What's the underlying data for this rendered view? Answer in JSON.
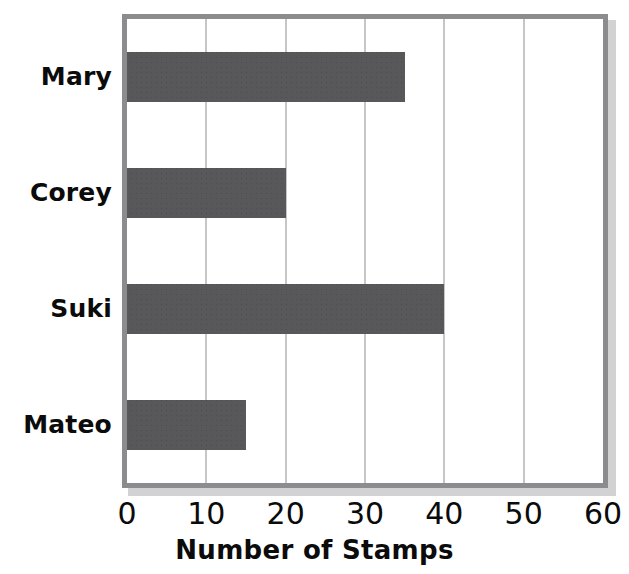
{
  "chart_data": {
    "type": "bar",
    "orientation": "horizontal",
    "title": "",
    "xlabel": "Number of Stamps",
    "ylabel": "",
    "categories": [
      "Mary",
      "Corey",
      "Suki",
      "Mateo"
    ],
    "values": [
      35,
      20,
      40,
      15
    ],
    "xlim": [
      0,
      60
    ],
    "xticks": [
      0,
      10,
      20,
      30,
      40,
      50,
      60
    ],
    "xtick_labels": [
      "0",
      "10",
      "20",
      "30",
      "40",
      "50",
      "60"
    ],
    "grid": "vertical",
    "legend": "none",
    "bar_color": "#58585a",
    "gridline_color": "#c6c6c6",
    "frame_color": "#8c8c8e",
    "text_color": "#0b0b0b",
    "background": "#ffffff"
  },
  "axis": {
    "x_title": "Number of Stamps",
    "ticks": [
      "0",
      "10",
      "20",
      "30",
      "40",
      "50",
      "60"
    ]
  },
  "bars": [
    {
      "label": "Mary",
      "value": 35
    },
    {
      "label": "Corey",
      "value": 20
    },
    {
      "label": "Suki",
      "value": 40
    },
    {
      "label": "Mateo",
      "value": 15
    }
  ],
  "title_fragment": "·"
}
